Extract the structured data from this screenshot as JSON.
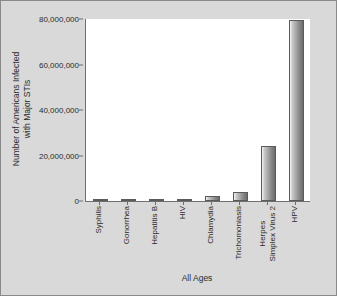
{
  "chart_data": {
    "type": "bar",
    "title": "",
    "xlabel": "All Ages",
    "ylabel": "Number of Americans Infected with Major STIs",
    "ylabel_line1": "Number of Americans Infected",
    "ylabel_line2": "with Major STIs",
    "categories": [
      "Syphilis",
      "Gonorrhea",
      "Hepatitis B",
      "HIV",
      "Chlamydia",
      "Trichomoniasis",
      "Herpes Simplex Virus 2",
      "HPV"
    ],
    "category_lines": [
      [
        "Syphilis"
      ],
      [
        "Gonorrhea"
      ],
      [
        "Hepatitis B"
      ],
      [
        "HIV"
      ],
      [
        "Chlamydia"
      ],
      [
        "Trichomoniasis"
      ],
      [
        "Herpes",
        "Simplex Virus 2"
      ],
      [
        "HPV"
      ]
    ],
    "values": [
      200000,
      400000,
      420000,
      900000,
      2000000,
      4000000,
      24000000,
      79500000
    ],
    "ylim": [
      0,
      80000000
    ],
    "yticks": [
      0,
      20000000,
      40000000,
      60000000,
      80000000
    ],
    "ytick_labels": [
      "0",
      "20,000,000",
      "40,000,000",
      "60,000,000",
      "80,000,000"
    ],
    "grid": false,
    "legend": false,
    "bar_color": "#8f8f8f",
    "plot_background": "#ffffff",
    "figure_background": "#d9d9d9"
  }
}
